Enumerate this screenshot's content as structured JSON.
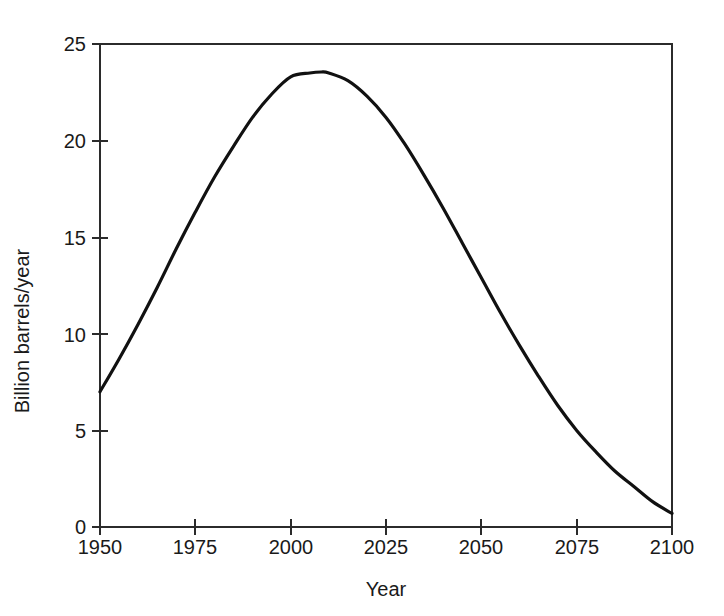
{
  "chart_data": {
    "type": "line",
    "title": "",
    "xlabel": "Year",
    "ylabel": "Billion barrels/year",
    "xlim": [
      1950,
      2100
    ],
    "ylim": [
      0,
      25
    ],
    "xticks": [
      1950,
      1975,
      2000,
      2025,
      2050,
      2075,
      2100
    ],
    "yticks": [
      0,
      5,
      10,
      15,
      20,
      25
    ],
    "xtick_labels": [
      "1950",
      "1975",
      "2000",
      "2025",
      "2050",
      "2075",
      "2100"
    ],
    "ytick_labels": [
      "0",
      "5",
      "10",
      "15",
      "20",
      "25"
    ],
    "grid": false,
    "legend": null,
    "legend_position": "none",
    "line_color": "#111111",
    "line_width": 3.2,
    "frame_color": "#2b2b2b",
    "background_color": "#ffffff",
    "series": [
      {
        "name": "World oil production",
        "x": [
          1950,
          1955,
          1960,
          1965,
          1970,
          1975,
          1980,
          1985,
          1990,
          1995,
          2000,
          2005,
          2008,
          2010,
          2015,
          2020,
          2025,
          2030,
          2035,
          2040,
          2045,
          2050,
          2055,
          2060,
          2065,
          2070,
          2075,
          2080,
          2085,
          2090,
          2095,
          2100
        ],
        "values": [
          7.0,
          8.7,
          10.5,
          12.4,
          14.4,
          16.3,
          18.1,
          19.7,
          21.2,
          22.4,
          23.3,
          23.5,
          23.55,
          23.5,
          23.1,
          22.3,
          21.2,
          19.8,
          18.2,
          16.5,
          14.7,
          12.9,
          11.1,
          9.4,
          7.8,
          6.3,
          5.0,
          3.9,
          2.9,
          2.1,
          1.3,
          0.7
        ]
      }
    ],
    "annotations": []
  },
  "axes": {
    "ylabel_text": "Billion barrels/year",
    "xlabel_text": "Year"
  }
}
